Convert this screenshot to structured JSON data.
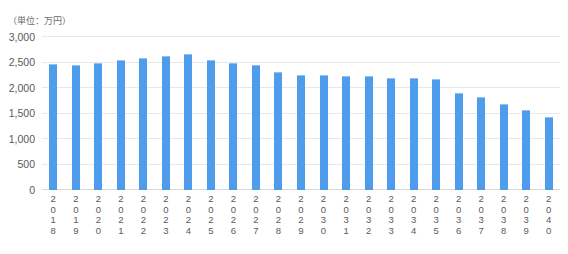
{
  "chart_data": {
    "type": "bar",
    "title": "",
    "subtitle": "",
    "unit_caption": "（単位：万円）",
    "xlabel": "",
    "ylabel": "",
    "ylim": [
      0,
      3000
    ],
    "y_ticks": [
      0,
      500,
      1000,
      1500,
      2000,
      2500,
      3000
    ],
    "y_tick_labels": [
      "0",
      "500",
      "1,000",
      "1,500",
      "2,000",
      "2,500",
      "3,000"
    ],
    "grid": true,
    "legend": false,
    "legend_position": "none",
    "bar_color": "#4e9cec",
    "gridline_color": "#e8e8e8",
    "categories": [
      "2018",
      "2019",
      "2020",
      "2021",
      "2022",
      "2023",
      "2024",
      "2025",
      "2026",
      "2027",
      "2028",
      "2029",
      "2030",
      "2031",
      "2032",
      "2033",
      "2034",
      "2035",
      "2036",
      "2037",
      "2038",
      "2039",
      "2040"
    ],
    "values": [
      2470,
      2450,
      2490,
      2540,
      2580,
      2620,
      2670,
      2550,
      2500,
      2450,
      2310,
      2260,
      2250,
      2230,
      2230,
      2200,
      2190,
      2170,
      1900,
      1830,
      1680,
      1570,
      1440
    ],
    "series": [
      {
        "name": "",
        "values": [
          2470,
          2450,
          2490,
          2540,
          2580,
          2620,
          2670,
          2550,
          2500,
          2450,
          2310,
          2260,
          2250,
          2230,
          2230,
          2200,
          2190,
          2170,
          1900,
          1830,
          1680,
          1570,
          1440
        ]
      }
    ]
  }
}
